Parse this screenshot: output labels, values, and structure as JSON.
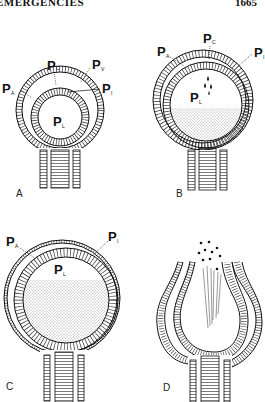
{
  "header": {
    "running_title": "EMERGENCIES",
    "page_number": "1665"
  },
  "figure": {
    "panels": [
      {
        "id": "A",
        "letter": "A",
        "labels": [
          {
            "main": "P",
            "sub": "C"
          },
          {
            "main": "P",
            "sub": "V"
          },
          {
            "main": "P",
            "sub": "A"
          },
          {
            "main": "P",
            "sub": "I"
          },
          {
            "main": "P",
            "sub": "L"
          }
        ]
      },
      {
        "id": "B",
        "letter": "B",
        "labels": [
          {
            "main": "P",
            "sub": "C"
          },
          {
            "main": "P",
            "sub": "A"
          },
          {
            "main": "P",
            "sub": "I"
          },
          {
            "main": "P",
            "sub": "L"
          }
        ]
      },
      {
        "id": "C",
        "letter": "C",
        "labels": [
          {
            "main": "P",
            "sub": "A"
          },
          {
            "main": "P",
            "sub": "I"
          },
          {
            "main": "P",
            "sub": "L"
          }
        ]
      },
      {
        "id": "D",
        "letter": "D",
        "labels": []
      }
    ]
  }
}
